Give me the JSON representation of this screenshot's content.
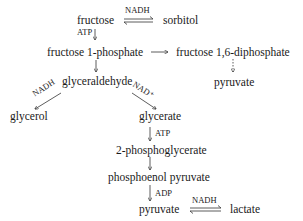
{
  "nodes": {
    "fructose": "fructose",
    "sorbitol": "sorbitol",
    "fructose_1_phosphate": "fructose 1-phosphate",
    "fructose_16_diphosphate": "fructose 1,6-diphosphate",
    "pyruvate_top": "pyruvate",
    "glyceraldehyde": "glyceraldehyde",
    "glycerol": "glycerol",
    "glycerate": "glycerate",
    "phosphoglycerate": "2-phosphoglycerate",
    "phosphoenol_pyruvate": "phosphoenol pyruvate",
    "pyruvate_bottom": "pyruvate",
    "lactate": "lactate"
  },
  "cofactors": {
    "fructose_sorbitol": "NADH",
    "fructose_atp": "ATP",
    "glycerol_nadh": "NADH",
    "glycerate_nad": "NAD⁺",
    "glycerate_atp": "ATP",
    "pep_adp": "ADP",
    "pyruvate_lactate": "NADH"
  }
}
